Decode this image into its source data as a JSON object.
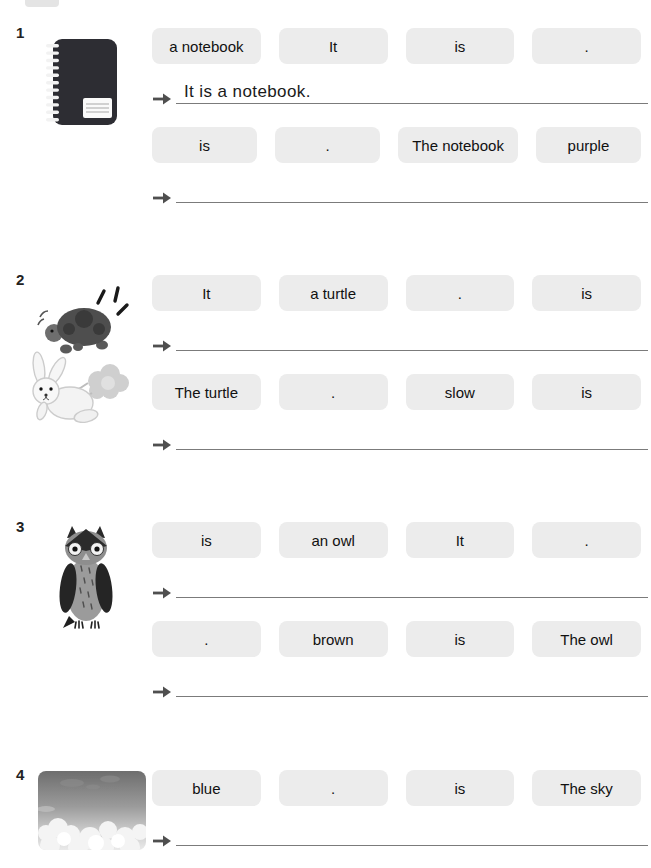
{
  "colors": {
    "chip_bg": "#ececec",
    "chip_text": "#111111",
    "answer_line": "#7b7b7b",
    "arrow": "#4f4f4f",
    "number_text": "#222222"
  },
  "sections": [
    {
      "number": "1",
      "image": "notebook-illustration",
      "rows": [
        {
          "chips": [
            "a notebook",
            "It",
            "is",
            "."
          ],
          "answer": "It is a notebook."
        },
        {
          "chips": [
            "is",
            ".",
            "The notebook",
            "purple"
          ],
          "answer": ""
        }
      ]
    },
    {
      "number": "2",
      "image": "turtle-and-rabbit-illustration",
      "rows": [
        {
          "chips": [
            "It",
            "a turtle",
            ".",
            "is"
          ],
          "answer": ""
        },
        {
          "chips": [
            "The turtle",
            ".",
            "slow",
            "is"
          ],
          "answer": ""
        }
      ]
    },
    {
      "number": "3",
      "image": "owl-illustration",
      "rows": [
        {
          "chips": [
            "is",
            "an owl",
            "It",
            "."
          ],
          "answer": ""
        },
        {
          "chips": [
            ".",
            "brown",
            "is",
            "The owl"
          ],
          "answer": ""
        }
      ]
    },
    {
      "number": "4",
      "image": "sky-illustration",
      "rows": [
        {
          "chips": [
            "blue",
            ".",
            "is",
            "The sky"
          ],
          "answer": ""
        }
      ]
    }
  ]
}
